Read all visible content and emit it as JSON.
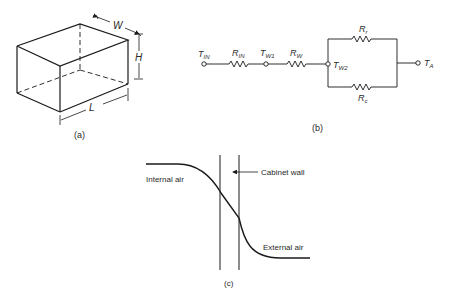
{
  "figure_a": {
    "caption": "(a)",
    "dimensions": {
      "width": "W",
      "height": "H",
      "length": "L"
    }
  },
  "figure_b": {
    "caption": "(b)",
    "nodes": [
      {
        "main": "T",
        "sub": "IN"
      },
      {
        "main": "T",
        "sub": "W1"
      },
      {
        "main": "T",
        "sub": "W2"
      },
      {
        "main": "T",
        "sub": "A"
      }
    ],
    "resistors": [
      {
        "main": "R",
        "sub": "IN"
      },
      {
        "main": "R",
        "sub": "W"
      },
      {
        "main": "R",
        "sub": "r"
      },
      {
        "main": "R",
        "sub": "c"
      }
    ]
  },
  "figure_c": {
    "caption": "(c)",
    "labels": {
      "internal": "Internal air",
      "wall": "Cabinet wall",
      "external": "External air"
    }
  },
  "colors": {
    "ink": "#1a1a1a",
    "text": "#2a2a2a",
    "background": "#ffffff"
  }
}
